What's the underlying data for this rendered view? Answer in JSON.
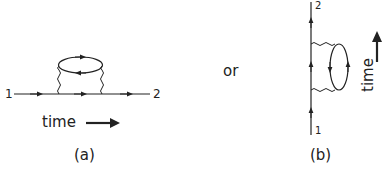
{
  "figure_a": {
    "start_label": "1",
    "end_label": "2",
    "time_label": "time",
    "caption": "(a)"
  },
  "connector": {
    "text": "or"
  },
  "figure_b": {
    "start_label": "1",
    "end_label": "2",
    "time_label": "time",
    "caption": "(b)"
  }
}
